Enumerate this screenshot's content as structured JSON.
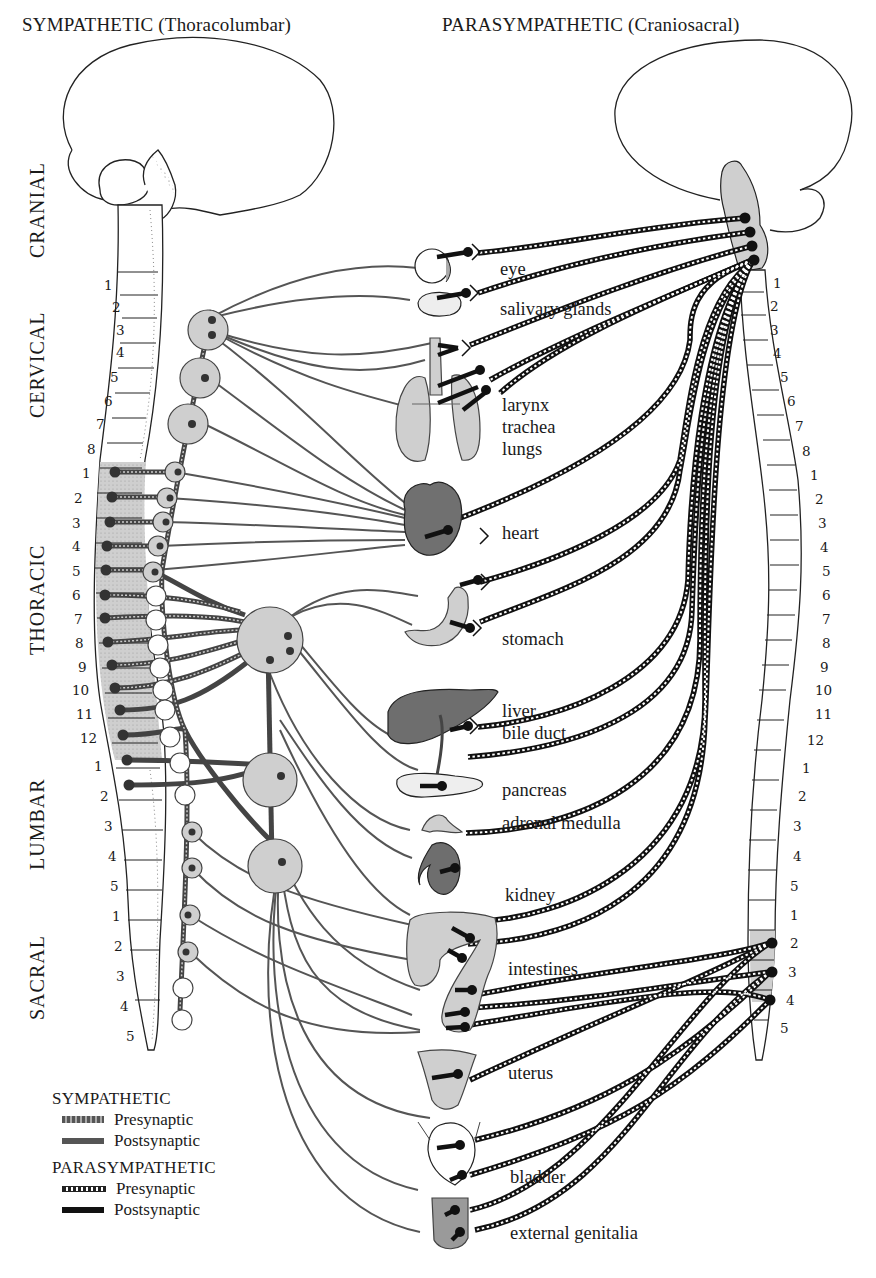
{
  "titles": {
    "sympathetic": "SYMPATHETIC (Thoracolumbar)",
    "parasympathetic": "PARASYMPATHETIC (Craniosacral)"
  },
  "regions": {
    "cranial": "CRANIAL",
    "cervical": "CERVICAL",
    "thoracic": "THORACIC",
    "lumbar": "LUMBAR",
    "sacral": "SACRAL"
  },
  "left_segments": {
    "cervical": [
      "1",
      "2",
      "3",
      "4",
      "5",
      "6",
      "7",
      "8"
    ],
    "thoracic": [
      "1",
      "2",
      "3",
      "4",
      "5",
      "6",
      "7",
      "8",
      "9",
      "10",
      "11",
      "12"
    ],
    "lumbar": [
      "1",
      "2",
      "3",
      "4",
      "5"
    ],
    "sacral": [
      "1",
      "2",
      "3",
      "4",
      "5"
    ]
  },
  "right_segments": {
    "cervical": [
      "1",
      "2",
      "3",
      "4",
      "5",
      "6",
      "7",
      "8"
    ],
    "thoracic": [
      "1",
      "2",
      "3",
      "4",
      "5",
      "6",
      "7",
      "8",
      "9",
      "10",
      "11",
      "12"
    ],
    "lumbar": [
      "1",
      "2",
      "3",
      "4",
      "5"
    ],
    "sacral": [
      "1",
      "2",
      "3",
      "4",
      "5"
    ]
  },
  "organs": [
    {
      "id": "eye",
      "label": "eye"
    },
    {
      "id": "salivary",
      "label": "salivary glands"
    },
    {
      "id": "lungs",
      "label": "larynx\ntrachea\nlungs"
    },
    {
      "id": "heart",
      "label": "heart"
    },
    {
      "id": "stomach",
      "label": "stomach"
    },
    {
      "id": "liver",
      "label": "liver\nbile duct"
    },
    {
      "id": "pancreas",
      "label": "pancreas"
    },
    {
      "id": "adrenal",
      "label": "adrenal medulla"
    },
    {
      "id": "kidney",
      "label": "kidney"
    },
    {
      "id": "intestines",
      "label": "intestines"
    },
    {
      "id": "uterus",
      "label": "uterus"
    },
    {
      "id": "bladder",
      "label": "bladder"
    },
    {
      "id": "genitalia",
      "label": "external genitalia"
    }
  ],
  "legend": {
    "sympathetic": {
      "heading": "SYMPATHETIC",
      "presynaptic": "Presynaptic",
      "postsynaptic": "Postsynaptic"
    },
    "parasympathetic": {
      "heading": "PARASYMPATHETIC",
      "presynaptic": "Presynaptic",
      "postsynaptic": "Postsynaptic"
    }
  },
  "colors": {
    "ink": "#1a1a1a",
    "gray_fill": "#cfcfcf",
    "dark_organ": "#6b6b6b",
    "sympathetic_line": "#555555",
    "background": "#ffffff"
  }
}
